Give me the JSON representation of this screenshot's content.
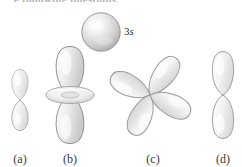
{
  "figure": {
    "width": 242,
    "height": 167,
    "background_color": "#ffffff",
    "cutoff_header_text": "e following questions."
  },
  "reference_orbital": {
    "label_number": "3",
    "label_subshell": "s",
    "label_full": "3s",
    "shape": "sphere",
    "center_x": 101,
    "center_y": 32,
    "radius": 19,
    "fill_color": "#d9d9d9",
    "stroke_color": "#8d8d8d",
    "highlight_color": "#f6f6f6"
  },
  "choices": [
    {
      "key": "a",
      "caption": "(a)",
      "shape": "p-orbital",
      "lobe_count": 2,
      "orientation": "vertical",
      "has_torus": false,
      "center_x": 20,
      "center_y": 100,
      "caption_x": 20,
      "caption_y": 152,
      "lobe_width": 14,
      "lobe_height": 28,
      "fill_color": "#e8e8e8",
      "stroke_color": "#a8a8a8"
    },
    {
      "key": "b",
      "caption": "(b)",
      "shape": "d-z2-orbital",
      "lobe_count": 2,
      "orientation": "vertical",
      "has_torus": true,
      "center_x": 70,
      "center_y": 95,
      "caption_x": 70,
      "caption_y": 152,
      "lobe_width": 26,
      "lobe_height": 45,
      "torus_rx": 24,
      "torus_ry": 8,
      "fill_color": "#dedede",
      "stroke_color": "#8f8f8f"
    },
    {
      "key": "c",
      "caption": "(c)",
      "shape": "d-cloverleaf-orbital",
      "lobe_count": 4,
      "orientation": "diagonal",
      "has_torus": false,
      "center_x": 150,
      "center_y": 95,
      "caption_x": 153,
      "caption_y": 152,
      "lobe_width": 25,
      "lobe_height": 44,
      "fill_color": "#ececec",
      "stroke_color": "#9a9a9a"
    },
    {
      "key": "d",
      "caption": "(d)",
      "shape": "p-orbital",
      "lobe_count": 2,
      "orientation": "vertical",
      "has_torus": false,
      "center_x": 223,
      "center_y": 95,
      "caption_x": 223,
      "caption_y": 152,
      "lobe_width": 20,
      "lobe_height": 38,
      "fill_color": "#ededed",
      "stroke_color": "#9d9d9d"
    }
  ]
}
